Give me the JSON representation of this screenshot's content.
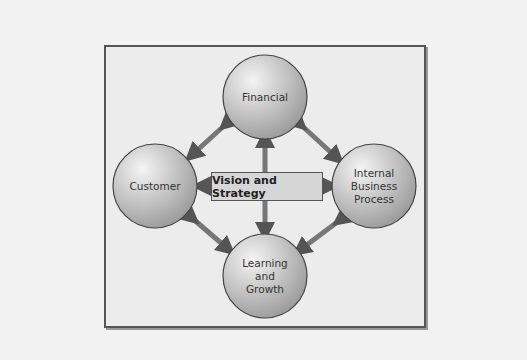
{
  "diagram": {
    "center": {
      "label": "Vision and Strategy"
    },
    "nodes": [
      {
        "id": "financial",
        "label": "Financial"
      },
      {
        "id": "customer",
        "label": "Customer"
      },
      {
        "id": "internal",
        "label": "Internal Business Process"
      },
      {
        "id": "learning",
        "label": "Learning and Growth"
      }
    ],
    "colors": {
      "circle_fill": "#c8c8c8",
      "arrow": "#6e6e6e",
      "frame_bg": "#ececec"
    }
  }
}
